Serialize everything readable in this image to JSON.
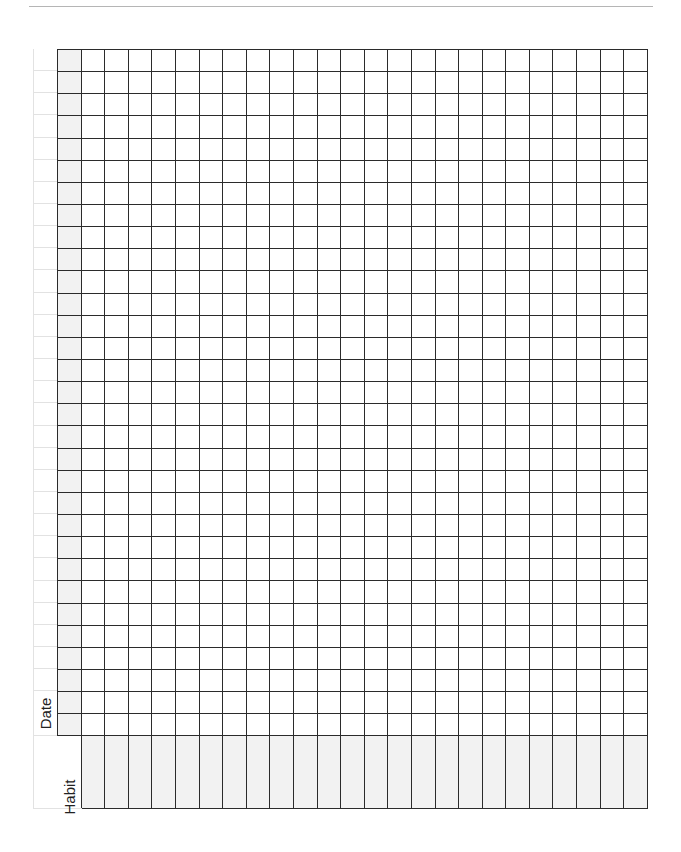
{
  "page": {
    "type": "habit tracker worksheet",
    "header_rule": true
  },
  "tracker": {
    "date_label": "Date",
    "habit_label": "Habit",
    "rows": 31,
    "day_columns": 24,
    "colors": {
      "grid_line": "#2b2b2b",
      "faint_line": "#e2e2e2",
      "shade": "#f2f2f2",
      "background": "#ffffff"
    }
  }
}
